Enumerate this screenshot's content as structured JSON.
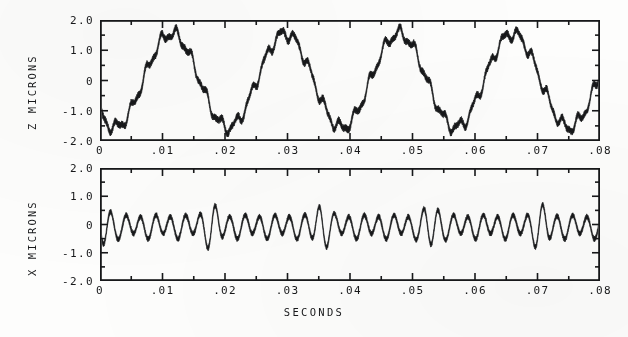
{
  "figure": {
    "xlabel": "SECONDS",
    "background_color": "#fdfdfc",
    "ink_color": "#17181a"
  },
  "chart_data": [
    {
      "type": "line",
      "panel_id": "top",
      "title": "",
      "ylabel": "Z MICRONS",
      "xlabel": "",
      "xlim": [
        0,
        0.08
      ],
      "ylim": [
        -2.0,
        2.0
      ],
      "xticks": [
        0,
        0.01,
        0.02,
        0.03,
        0.04,
        0.05,
        0.06,
        0.07,
        0.08
      ],
      "xticklabels": [
        "0",
        ".01",
        ".02",
        ".03",
        ".04",
        ".05",
        ".06",
        ".07",
        ".08"
      ],
      "yticks": [
        -2.0,
        -1.0,
        0,
        1.0,
        2.0
      ],
      "yticklabels": [
        "-2.0",
        "-1.0",
        "0",
        "1.0",
        "2.0"
      ],
      "minor_tick_interval_y": 0.5,
      "minor_tick_interval_x": 0.005,
      "grid": false,
      "legend": null,
      "series": [
        {
          "name": "Z displacement",
          "units": "microns",
          "description": "Large slow sinusoid with superimposed high-frequency ripple and band noise",
          "model": {
            "carrier_amplitude": 1.55,
            "carrier_frequency_hz": 55.0,
            "carrier_phase_rad": 3.9,
            "ripple_amplitude": 0.17,
            "ripple_frequency_hz": 420.0,
            "band_thickness": 0.1,
            "noise_amplitude": 0.05
          },
          "observed_peaks_microns": [
            1.65,
            1.7,
            1.65,
            1.68,
            1.6
          ],
          "observed_troughs_microns": [
            -1.7,
            -1.65,
            -1.6,
            -1.75,
            -1.6
          ],
          "peak_times_s": [
            0.0045,
            0.0225,
            0.04,
            0.0575,
            0.0755
          ],
          "trough_times_s": [
            0.014,
            0.0315,
            0.049,
            0.0665,
            0.08
          ],
          "start_value_microns": -0.65,
          "end_value_microns": 0.45
        }
      ]
    },
    {
      "type": "line",
      "panel_id": "bottom",
      "title": "",
      "ylabel": "X MICRONS",
      "xlabel": "SECONDS",
      "xlim": [
        0,
        0.08
      ],
      "ylim": [
        -2.0,
        2.0
      ],
      "xticks": [
        0,
        0.01,
        0.02,
        0.03,
        0.04,
        0.05,
        0.06,
        0.07,
        0.08
      ],
      "xticklabels": [
        "0",
        ".01",
        ".02",
        ".03",
        ".04",
        ".05",
        ".06",
        ".07",
        ".08"
      ],
      "yticks": [
        -2.0,
        -1.0,
        0,
        1.0,
        2.0
      ],
      "yticklabels": [
        "-2.0",
        "-1.0",
        "0",
        "1.0",
        "2.0"
      ],
      "minor_tick_interval_y": 0.5,
      "minor_tick_interval_x": 0.005,
      "grid": false,
      "legend": null,
      "series": [
        {
          "name": "X displacement",
          "units": "microns",
          "description": "High-frequency oscillation amplitude-modulated by a slow beat envelope",
          "model": {
            "carrier_frequency_hz": 420.0,
            "carrier_phase_rad": 3.2,
            "envelope_base": 0.36,
            "envelope_modulation": 0.38,
            "envelope_frequency_hz": 57.0,
            "envelope_phase_rad": 1.45,
            "offset_microns": -0.06,
            "band_thickness": 0.085,
            "noise_amplitude": 0.035
          },
          "observed_beat_peaks_microns": [
            1.1,
            1.05,
            1.1,
            1.1,
            1.1,
            1.05
          ],
          "beat_peak_times_s": [
            0.0095,
            0.0268,
            0.0443,
            0.0615,
            0.079
          ],
          "typical_peak_microns": 0.45,
          "typical_trough_microns": -0.55,
          "start_value_microns": -0.45,
          "end_value_microns": 0.55
        }
      ]
    }
  ]
}
